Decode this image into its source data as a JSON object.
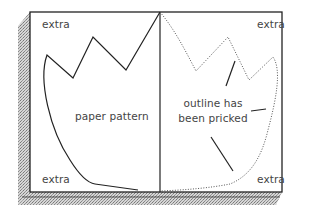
{
  "diagram": {
    "corner_labels": {
      "top_left": "extra",
      "top_right": "extra",
      "bottom_left": "extra",
      "bottom_right": "extra"
    },
    "left_panel": {
      "label": "paper pattern",
      "outline_style": "solid"
    },
    "right_panel": {
      "label_line1": "outline has",
      "label_line2": "been pricked",
      "outline_style": "dotted"
    },
    "colors": {
      "outline": "#222222",
      "text": "#444444",
      "board_edge": "#9a9a9a",
      "background": "#ffffff"
    }
  }
}
